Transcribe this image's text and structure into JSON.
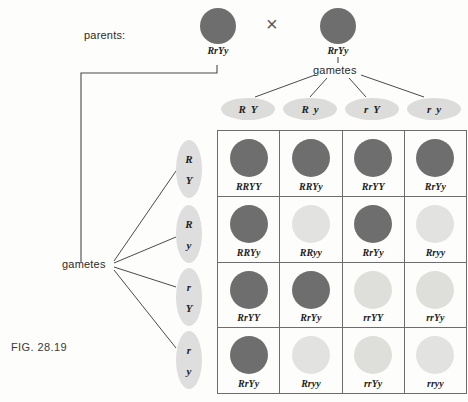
{
  "figure": {
    "fig_label": "FIG. 28.19",
    "parents_label": "parents:",
    "cross_symbol": "×",
    "gametes_label_top": "gametes",
    "gametes_label_left": "gametes"
  },
  "parents": [
    {
      "genotype": "RrYy",
      "phenotype": "dark"
    },
    {
      "genotype": "RrYy",
      "phenotype": "dark"
    }
  ],
  "top_gametes": [
    {
      "allele1": "R",
      "allele2": "Y"
    },
    {
      "allele1": "R",
      "allele2": "y"
    },
    {
      "allele1": "r",
      "allele2": "Y"
    },
    {
      "allele1": "r",
      "allele2": "y"
    }
  ],
  "left_gametes": [
    {
      "allele1": "R",
      "allele2": "Y"
    },
    {
      "allele1": "R",
      "allele2": "y"
    },
    {
      "allele1": "r",
      "allele2": "Y"
    },
    {
      "allele1": "r",
      "allele2": "y"
    }
  ],
  "colors": {
    "seed_dark": "#6e6e6e",
    "seed_light": "#e2e2e0",
    "seed_mottled_base": "#dededa",
    "seed_mottled_spots": "#7c7c7c",
    "gamete_ellipse": "#dcdcda",
    "grid_line": "#6d6d6d",
    "text": "#1e1e1e",
    "page_background": "#fdfdfc"
  },
  "punnett": {
    "rows": [
      {
        "cells": [
          {
            "genotype": "RRYY",
            "phenotype": "dark"
          },
          {
            "genotype": "RRYy",
            "phenotype": "dark"
          },
          {
            "genotype": "RrYY",
            "phenotype": "dark"
          },
          {
            "genotype": "RrYy",
            "phenotype": "dark"
          }
        ]
      },
      {
        "cells": [
          {
            "genotype": "RRYy",
            "phenotype": "dark"
          },
          {
            "genotype": "RRyy",
            "phenotype": "light"
          },
          {
            "genotype": "RrYy",
            "phenotype": "dark"
          },
          {
            "genotype": "Rryy",
            "phenotype": "light"
          }
        ]
      },
      {
        "cells": [
          {
            "genotype": "RrYY",
            "phenotype": "dark"
          },
          {
            "genotype": "RrYy",
            "phenotype": "dark"
          },
          {
            "genotype": "rrYY",
            "phenotype": "mottled"
          },
          {
            "genotype": "rrYy",
            "phenotype": "mottled"
          }
        ]
      },
      {
        "cells": [
          {
            "genotype": "RrYy",
            "phenotype": "dark"
          },
          {
            "genotype": "Rryy",
            "phenotype": "light"
          },
          {
            "genotype": "rrYy",
            "phenotype": "mottled"
          },
          {
            "genotype": "rryy",
            "phenotype": "light"
          }
        ]
      }
    ]
  }
}
